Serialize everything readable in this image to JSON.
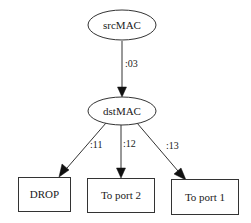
{
  "diagram": {
    "type": "decision-tree",
    "colors": {
      "stroke": "#333333",
      "text": "#1a1a1a",
      "background": "#ffffff"
    },
    "nodes": [
      {
        "id": "srcMAC",
        "label": "srcMAC",
        "shape": "ellipse"
      },
      {
        "id": "dstMAC",
        "label": "dstMAC",
        "shape": "ellipse"
      },
      {
        "id": "drop",
        "label": "DROP",
        "shape": "box"
      },
      {
        "id": "port2",
        "label": "To port 2",
        "shape": "box"
      },
      {
        "id": "port1",
        "label": "To port 1",
        "shape": "box"
      }
    ],
    "edges": [
      {
        "from": "srcMAC",
        "to": "dstMAC",
        "label": ":03"
      },
      {
        "from": "dstMAC",
        "to": "drop",
        "label": ":11"
      },
      {
        "from": "dstMAC",
        "to": "port2",
        "label": ":12"
      },
      {
        "from": "dstMAC",
        "to": "port1",
        "label": ":13"
      }
    ]
  }
}
